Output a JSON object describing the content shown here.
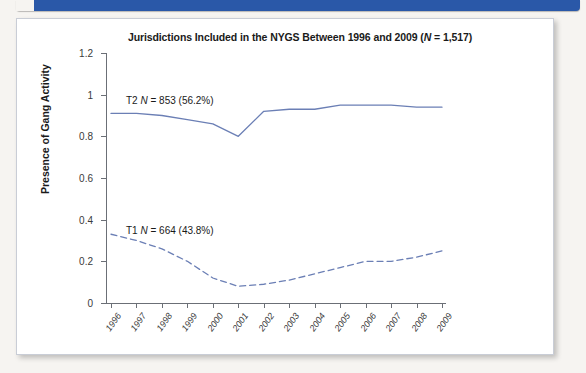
{
  "figure": {
    "banner_color": "#2a58a8",
    "card_background": "#ffffff"
  },
  "chart_data": {
    "type": "line",
    "title": "Jurisdictions Included in the NYGS Between 1996 and 2009 (N = 1,517)",
    "title_parts": {
      "lead": "Jurisdictions Included in the NYGS Between 1996 and 2009 (",
      "italic_n": "N",
      "tail": " = 1,517)"
    },
    "xlabel": "",
    "ylabel": "Presence of Gang Activity",
    "x": [
      1996,
      1997,
      1998,
      1999,
      2000,
      2001,
      2002,
      2003,
      2004,
      2005,
      2006,
      2007,
      2008,
      2009
    ],
    "xtick_labels": [
      "1996",
      "1997",
      "1998",
      "1999",
      "2000",
      "2001",
      "2002",
      "2003",
      "2004",
      "2005",
      "2006",
      "2007",
      "2008",
      "2009"
    ],
    "ylim": [
      0,
      1.2
    ],
    "ytick_labels": [
      "0",
      "0.2",
      "0.4",
      "0.6",
      "0.8",
      "1",
      "1.2"
    ],
    "ytick_values": [
      0,
      0.2,
      0.4,
      0.6,
      0.8,
      1,
      1.2
    ],
    "grid": false,
    "legend_position": "inside-plot-annotations",
    "series": [
      {
        "name": "T2",
        "style": "solid",
        "color": "#6b7fb5",
        "annotation": "T2  N = 853 (56.2%)",
        "annotation_parts": {
          "lead": "T2  ",
          "italic_n": "N",
          "tail": " = 853 (56.2%)"
        },
        "n": 853,
        "percent": "56.2%",
        "values": [
          0.91,
          0.91,
          0.9,
          0.88,
          0.86,
          0.8,
          0.92,
          0.93,
          0.93,
          0.95,
          0.95,
          0.95,
          0.94,
          0.94
        ]
      },
      {
        "name": "T1",
        "style": "dashed",
        "color": "#6b7fb5",
        "annotation": "T1  N = 664 (43.8%)",
        "annotation_parts": {
          "lead": "T1  ",
          "italic_n": "N",
          "tail": " = 664 (43.8%)"
        },
        "n": 664,
        "percent": "43.8%",
        "values": [
          0.33,
          0.3,
          0.26,
          0.2,
          0.12,
          0.08,
          0.09,
          0.11,
          0.14,
          0.17,
          0.2,
          0.2,
          0.22,
          0.25
        ]
      }
    ]
  }
}
